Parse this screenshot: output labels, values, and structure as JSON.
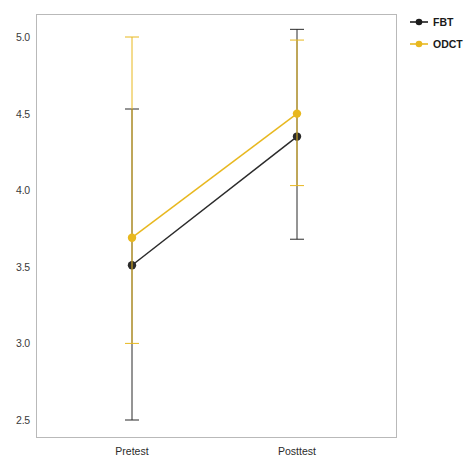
{
  "chart_data": {
    "type": "line",
    "title": "",
    "subtitle": "",
    "xlabel": "",
    "ylabel": "",
    "categories": [
      "Pretest",
      "Posttest"
    ],
    "x": [
      0,
      1
    ],
    "ylim": [
      2.38,
      5.12
    ],
    "yticks": [
      2.5,
      3.0,
      3.5,
      4.0,
      4.5,
      5.0
    ],
    "ytick_labels": [
      "2.5",
      "3.0",
      "3.5",
      "4.0",
      "4.5",
      "5.0"
    ],
    "grid": false,
    "legend_position": "top-right",
    "series": [
      {
        "name": "FBT",
        "color": "#2b2b2b",
        "marker": "circle",
        "values": [
          3.51,
          4.35
        ],
        "error_low": [
          2.5,
          3.68
        ],
        "error_high": [
          4.53,
          5.05
        ]
      },
      {
        "name": "ODCT",
        "color": "#e8b81f",
        "marker": "circle",
        "values": [
          3.69,
          4.5
        ],
        "error_low": [
          3.0,
          4.03
        ],
        "error_high": [
          5.0,
          4.98
        ]
      }
    ]
  },
  "legend": {
    "entries": [
      {
        "label": "FBT",
        "color": "#1c1c1c"
      },
      {
        "label": "ODCT",
        "color": "#e8b81f"
      }
    ]
  },
  "axes": {
    "y_tick_labels": [
      "5.0",
      "4.5",
      "4.0",
      "3.5",
      "3.0",
      "2.5"
    ],
    "x_tick_labels": [
      "Pretest",
      "Posttest"
    ]
  }
}
